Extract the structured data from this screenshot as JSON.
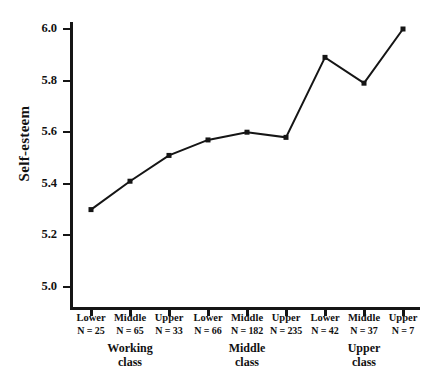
{
  "chart_data": {
    "type": "line",
    "title": "",
    "xlabel": "",
    "ylabel": "Self-esteem",
    "ylim": [
      5.0,
      6.0
    ],
    "yticks": [
      "5.0",
      "5.2",
      "5.4",
      "5.6",
      "5.8",
      "6.0"
    ],
    "ytick_values": [
      5.0,
      5.2,
      5.4,
      5.6,
      5.8,
      6.0
    ],
    "grid": false,
    "legend": "none",
    "marker": "filled-square",
    "line_color": "#151515",
    "categories": [
      "Lower",
      "Middle",
      "Upper",
      "Lower",
      "Middle",
      "Upper",
      "Lower",
      "Middle",
      "Upper"
    ],
    "values": [
      5.3,
      5.41,
      5.51,
      5.57,
      5.6,
      5.58,
      5.89,
      5.79,
      6.0
    ],
    "points": [
      {
        "category": "Lower",
        "n_label": "N = 25",
        "n": 25,
        "value": 5.3,
        "group": "Working class"
      },
      {
        "category": "Middle",
        "n_label": "N = 65",
        "n": 65,
        "value": 5.41,
        "group": "Working class"
      },
      {
        "category": "Upper",
        "n_label": "N = 33",
        "n": 33,
        "value": 5.51,
        "group": "Working class"
      },
      {
        "category": "Lower",
        "n_label": "N = 66",
        "n": 66,
        "value": 5.57,
        "group": "Middle class"
      },
      {
        "category": "Middle",
        "n_label": "N = 182",
        "n": 182,
        "value": 5.6,
        "group": "Middle class"
      },
      {
        "category": "Upper",
        "n_label": "N = 235",
        "n": 235,
        "value": 5.58,
        "group": "Middle class"
      },
      {
        "category": "Lower",
        "n_label": "N = 42",
        "n": 42,
        "value": 5.89,
        "group": "Upper class"
      },
      {
        "category": "Middle",
        "n_label": "N = 37",
        "n": 37,
        "value": 5.79,
        "group": "Upper class"
      },
      {
        "category": "Upper",
        "n_label": "N = 7",
        "n": 7,
        "value": 6.0,
        "group": "Upper class"
      }
    ],
    "groups": [
      {
        "line1": "Working",
        "line2": "class",
        "start_index": 0,
        "end_index": 2
      },
      {
        "line1": "Middle",
        "line2": "class",
        "start_index": 3,
        "end_index": 5
      },
      {
        "line1": "Upper",
        "line2": "class",
        "start_index": 6,
        "end_index": 8
      }
    ]
  }
}
